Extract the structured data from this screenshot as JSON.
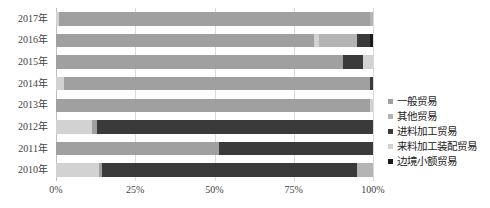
{
  "chart_data": {
    "type": "bar",
    "orientation": "horizontal",
    "stacked": true,
    "normalized": "100%",
    "title": "",
    "subtitle": "",
    "xlabel": "",
    "ylabel": "",
    "xlim": [
      0,
      100
    ],
    "xticks": [
      0,
      25,
      50,
      75,
      100
    ],
    "xtick_labels": [
      "0%",
      "25%",
      "50%",
      "75%",
      "100%"
    ],
    "grid": true,
    "grid_axis": "x",
    "legend_position": "right",
    "categories": [
      "2017年",
      "2016年",
      "2015年",
      "2014年",
      "2013年",
      "2012年",
      "2011年",
      "2010年"
    ],
    "series": [
      {
        "name": "一般贸易",
        "color": "#a0a0a0",
        "values": [
          99.0,
          82.0,
          91.0,
          96.5,
          99.0,
          0.0,
          52.0,
          0.0
        ]
      },
      {
        "name": "其他贸易",
        "color": "#b4b4b4",
        "values": [
          0.0,
          11.0,
          0.0,
          0.0,
          0.0,
          0.0,
          0.0,
          5.0
        ]
      },
      {
        "name": "进料加工贸易",
        "color": "#3a3a3a",
        "values": [
          0.0,
          4.0,
          6.0,
          1.0,
          0.0,
          88.0,
          48.0,
          81.0
        ]
      },
      {
        "name": "来料加工装配贸易",
        "color": "#d2d2d2",
        "values": [
          1.0,
          3.0,
          3.0,
          2.5,
          1.0,
          12.0,
          0.0,
          14.0
        ]
      },
      {
        "name": "边境小额贸易",
        "color": "#1a1a1a",
        "values": [
          0.0,
          0.0,
          0.0,
          0.0,
          0.0,
          0.0,
          0.0,
          0.0
        ]
      }
    ],
    "stack_order_by_row": [
      [
        {
          "series": "来料加工装配贸易",
          "start": 0.0,
          "width": 0.8
        },
        {
          "series": "一般贸易",
          "start": 0.8,
          "width": 98.2
        },
        {
          "series": "其他贸易",
          "start": 99.0,
          "width": 1.0
        }
      ],
      [
        {
          "series": "一般贸易",
          "start": 0.0,
          "width": 81.5
        },
        {
          "series": "来料加工装配贸易",
          "start": 81.5,
          "width": 1.5
        },
        {
          "series": "其他贸易",
          "start": 83.0,
          "width": 12.0
        },
        {
          "series": "进料加工贸易",
          "start": 95.0,
          "width": 4.0
        },
        {
          "series": "边境小额贸易",
          "start": 99.0,
          "width": 1.0
        }
      ],
      [
        {
          "series": "一般贸易",
          "start": 0.0,
          "width": 90.5
        },
        {
          "series": "进料加工贸易",
          "start": 90.5,
          "width": 6.5
        },
        {
          "series": "来料加工装配贸易",
          "start": 97.0,
          "width": 3.0
        }
      ],
      [
        {
          "series": "来料加工装配贸易",
          "start": 0.0,
          "width": 2.5
        },
        {
          "series": "一般贸易",
          "start": 2.5,
          "width": 96.5
        },
        {
          "series": "进料加工贸易",
          "start": 99.0,
          "width": 1.0
        }
      ],
      [
        {
          "series": "一般贸易",
          "start": 0.0,
          "width": 99.0
        },
        {
          "series": "来料加工装配贸易",
          "start": 99.0,
          "width": 1.0
        }
      ],
      [
        {
          "series": "来料加工装配贸易",
          "start": 0.0,
          "width": 11.5
        },
        {
          "series": "一般贸易",
          "start": 11.5,
          "width": 1.5
        },
        {
          "series": "进料加工贸易",
          "start": 13.0,
          "width": 87.0
        }
      ],
      [
        {
          "series": "一般贸易",
          "start": 0.0,
          "width": 51.5
        },
        {
          "series": "进料加工贸易",
          "start": 51.5,
          "width": 48.5
        }
      ],
      [
        {
          "series": "来料加工装配贸易",
          "start": 0.0,
          "width": 13.5
        },
        {
          "series": "一般贸易",
          "start": 13.5,
          "width": 1.0
        },
        {
          "series": "进料加工贸易",
          "start": 14.5,
          "width": 80.5
        },
        {
          "series": "其他贸易",
          "start": 95.0,
          "width": 5.0
        }
      ]
    ]
  },
  "legend": {
    "items": [
      {
        "label": "一般贸易",
        "color": "#a0a0a0"
      },
      {
        "label": "其他贸易",
        "color": "#b4b4b4"
      },
      {
        "label": "进料加工贸易",
        "color": "#3a3a3a"
      },
      {
        "label": "来料加工装配贸易",
        "color": "#d2d2d2"
      },
      {
        "label": "边境小额贸易",
        "color": "#1a1a1a"
      }
    ]
  },
  "axis": {
    "y_labels": [
      "2017年",
      "2016年",
      "2015年",
      "2014年",
      "2013年",
      "2012年",
      "2011年",
      "2010年"
    ],
    "x_labels": [
      "0%",
      "25%",
      "50%",
      "75%",
      "100%"
    ]
  }
}
